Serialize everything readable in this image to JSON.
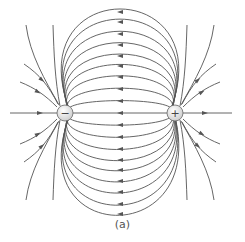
{
  "figure": {
    "caption": "(a)",
    "line_color": "#555555",
    "charge_fill": "#e8e8e8",
    "charges": [
      {
        "sign": "−",
        "label": "negative-charge",
        "cx": 65,
        "cy": 113
      },
      {
        "sign": "+",
        "label": "positive-charge",
        "cx": 175,
        "cy": 113
      }
    ]
  }
}
